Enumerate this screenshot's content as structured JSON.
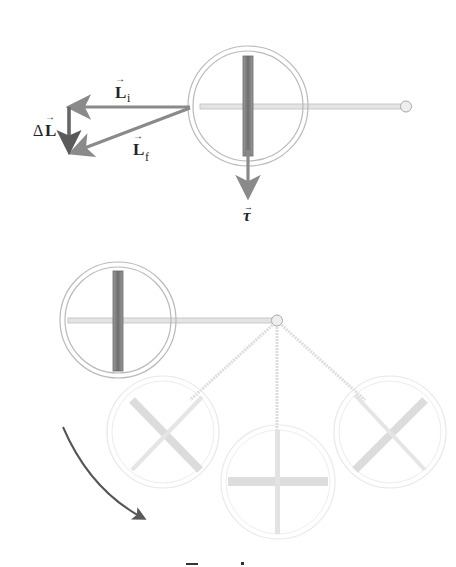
{
  "figure": {
    "type": "physics-diagram",
    "topic": "gyroscope precession",
    "colors": {
      "background": "#ffffff",
      "vector_arrow": "#8a8a8a",
      "dark_arrow": "#555555",
      "wheel_rim": "#b9b9b9",
      "wheel_spoke_dark": "#7c7c7c",
      "axle": "#c8c8c8",
      "faded": "#dcdcdc",
      "text": "#222222"
    }
  },
  "top_panel": {
    "vectors": [
      {
        "name": "L_i",
        "symbol": "L",
        "subscript": "i",
        "description": "initial angular momentum"
      },
      {
        "name": "L_f",
        "symbol": "L",
        "subscript": "f",
        "description": "final angular momentum"
      },
      {
        "name": "delta_L",
        "prefix": "Δ",
        "symbol": "L",
        "subscript": "",
        "description": "change in angular momentum"
      },
      {
        "name": "tau",
        "symbol": "τ",
        "subscript": "",
        "description": "torque"
      }
    ],
    "labels": {
      "li_symbol": "L",
      "li_sub": "i",
      "lf_symbol": "L",
      "lf_sub": "f",
      "dl_prefix": "Δ",
      "dl_symbol": "L",
      "tau_symbol": "τ"
    }
  },
  "bottom_panel": {
    "wheel_positions": [
      "horizontal-left (solid)",
      "lower-left (faded)",
      "bottom (faded)",
      "lower-right (faded)"
    ],
    "rotation_arrow": "clockwise-downward"
  },
  "caption": {
    "text": "Top view",
    "clipped": true
  }
}
